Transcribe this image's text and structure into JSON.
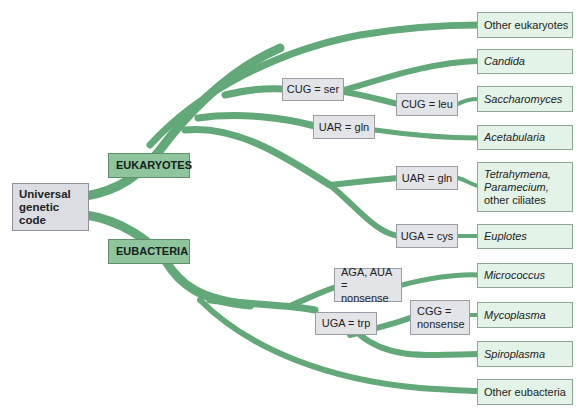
{
  "diagram": {
    "type": "tree",
    "branch_color": "#62a878",
    "root": {
      "label": "Universal genetic code",
      "line1": "Universal",
      "line2": "genetic code"
    },
    "clades": {
      "eukaryotes": "EUKARYOTES",
      "eubacteria": "EUBACTERIA"
    },
    "changes": {
      "cug_ser": "CUG = ser",
      "cug_leu": "CUG = leu",
      "uar_gln_1": "UAR = gln",
      "uar_gln_2": "UAR = gln",
      "uga_cys": "UGA = cys",
      "aga_aua_line1": "AGA, AUA =",
      "aga_aua_line2": "nonsense",
      "uga_trp": "UGA = trp",
      "cgg_line1": "CGG =",
      "cgg_line2": "nonsense"
    },
    "leaves": {
      "other_eukaryotes": "Other eukaryotes",
      "candida": "Candida",
      "saccharomyces": "Saccharomyces",
      "acetabularia": "Acetabularia",
      "ciliates_line1": "Tetrahymena,",
      "ciliates_line2": "Paramecium,",
      "ciliates_line3": "other ciliates",
      "euplotes": "Euplotes",
      "micrococcus": "Micrococcus",
      "mycoplasma": "Mycoplasma",
      "spiroplasma": "Spiroplasma",
      "other_eubacteria": "Other eubacteria"
    }
  }
}
